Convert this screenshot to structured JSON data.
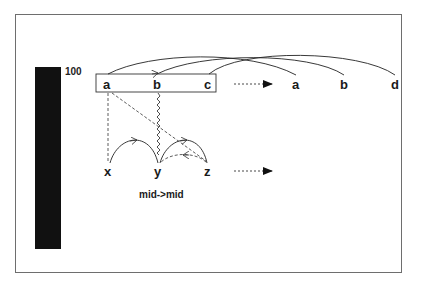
{
  "bar": {
    "label": "100",
    "color": "#111111"
  },
  "box": {
    "nodes": [
      "a",
      "b",
      "c"
    ]
  },
  "output_nodes": [
    "a",
    "b",
    "d"
  ],
  "bottom_nodes": [
    "x",
    "y",
    "z"
  ],
  "caption": "mid->mid",
  "arrows": {
    "top_mapping": "dotted-arrow-right",
    "bottom_mapping": "dotted-arrow-right"
  }
}
